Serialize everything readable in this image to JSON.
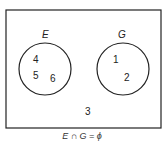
{
  "diagram": {
    "type": "venn",
    "universe_elements": [
      "3"
    ],
    "sets": [
      {
        "name": "E",
        "elements": [
          "4",
          "5",
          "6"
        ]
      },
      {
        "name": "G",
        "elements": [
          "1",
          "2"
        ]
      }
    ],
    "caption": "E ∩ G = ϕ"
  }
}
